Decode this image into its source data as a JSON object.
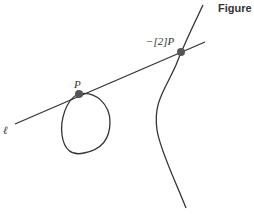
{
  "title": "Figure 2",
  "labels": {
    "line": "ℓ",
    "point_p": "P",
    "point_neg2p": "−[2]P"
  },
  "colors": {
    "stroke": "#333333",
    "point": "#555555",
    "background": "#ffffff"
  }
}
